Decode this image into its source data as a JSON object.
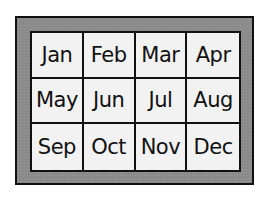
{
  "calendar": {
    "months": [
      "Jan",
      "Feb",
      "Mar",
      "Apr",
      "May",
      "Jun",
      "Jul",
      "Aug",
      "Sep",
      "Oct",
      "Nov",
      "Dec"
    ],
    "colors": {
      "frame": "#8a8a8a",
      "cells": "#f2f2f2",
      "lines": "#111111"
    }
  }
}
